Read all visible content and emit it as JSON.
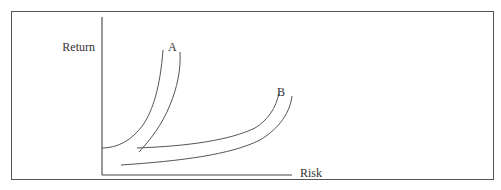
{
  "figure": {
    "frame": {
      "border_color": "#555555",
      "background": "#ffffff"
    },
    "axes": {
      "y_label": "Return",
      "x_label": "Risk",
      "line_color": "#444444"
    },
    "curves": [
      {
        "id": "A",
        "label": "A",
        "description": "Pair of steep indifference curves (high risk aversion)"
      },
      {
        "id": "B",
        "label": "B",
        "description": "Pair of flatter indifference curves (lower risk aversion)"
      }
    ],
    "curve_color": "#555555"
  }
}
